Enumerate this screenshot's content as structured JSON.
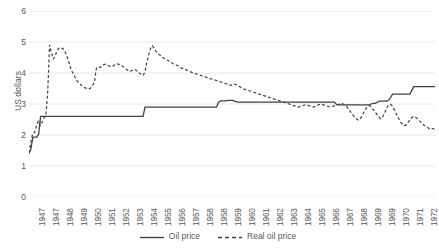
{
  "chart_data": {
    "type": "line",
    "title": "",
    "xlabel": "",
    "ylabel": "US dollars",
    "ylim": [
      0,
      6
    ],
    "yticks": [
      0,
      1,
      2,
      3,
      4,
      5,
      6
    ],
    "grid": true,
    "legend_position": "bottom",
    "xtick_labels": [
      "1947",
      "1947",
      "1948",
      "1949",
      "1950",
      "1951",
      "1952",
      "1953",
      "1954",
      "1955",
      "1956",
      "1957",
      "1958",
      "1958",
      "1959",
      "1960",
      "1961",
      "1962",
      "1963",
      "1964",
      "1965",
      "1966",
      "1967",
      "1968",
      "1969",
      "1969",
      "1970",
      "1971",
      "1972"
    ],
    "series": [
      {
        "name": "Oil price",
        "style": "solid",
        "color": "#404040",
        "values": [
          1.4,
          1.55,
          1.93,
          1.93,
          1.93,
          2.03,
          2.6,
          2.6,
          2.6,
          2.6,
          2.6,
          2.6,
          2.6,
          2.6,
          2.6,
          2.6,
          2.6,
          2.6,
          2.6,
          2.6,
          2.6,
          2.6,
          2.6,
          2.6,
          2.6,
          2.6,
          2.6,
          2.6,
          2.6,
          2.6,
          2.6,
          2.6,
          2.6,
          2.6,
          2.6,
          2.6,
          2.6,
          2.6,
          2.6,
          2.6,
          2.6,
          2.6,
          2.6,
          2.6,
          2.6,
          2.6,
          2.6,
          2.6,
          2.6,
          2.6,
          2.6,
          2.6,
          2.6,
          2.6,
          2.6,
          2.6,
          2.6,
          2.6,
          2.6,
          2.6,
          2.9,
          2.9,
          2.9,
          2.9,
          2.9,
          2.9,
          2.9,
          2.9,
          2.9,
          2.9,
          2.9,
          2.9,
          2.9,
          2.9,
          2.9,
          2.9,
          2.9,
          2.9,
          2.9,
          2.9,
          2.9,
          2.9,
          2.9,
          2.9,
          2.9,
          2.9,
          2.9,
          2.9,
          2.9,
          2.9,
          2.9,
          2.9,
          2.9,
          2.9,
          2.9,
          2.9,
          2.9,
          2.9,
          3.05,
          3.1,
          3.1,
          3.1,
          3.1,
          3.12,
          3.12,
          3.12,
          3.1,
          3.08,
          3.06,
          3.06,
          3.06,
          3.06,
          3.06,
          3.06,
          3.06,
          3.06,
          3.06,
          3.06,
          3.06,
          3.06,
          3.06,
          3.06,
          3.06,
          3.06,
          3.06,
          3.06,
          3.06,
          3.06,
          3.06,
          3.06,
          3.06,
          3.06,
          3.06,
          3.06,
          3.06,
          3.06,
          3.06,
          3.06,
          3.06,
          3.06,
          3.06,
          3.06,
          3.06,
          3.06,
          3.06,
          3.06,
          3.06,
          3.06,
          3.06,
          3.06,
          3.06,
          3.06,
          3.06,
          3.06,
          3.06,
          3.06,
          3.06,
          3.06,
          3.06,
          2.99,
          2.97,
          2.97,
          2.97,
          2.97,
          2.97,
          2.97,
          2.97,
          2.97,
          2.97,
          2.97,
          2.97,
          2.97,
          2.97,
          2.97,
          2.97,
          2.97,
          2.97,
          3.0,
          3.02,
          3.02,
          3.05,
          3.09,
          3.09,
          3.09,
          3.09,
          3.09,
          3.12,
          3.2,
          3.32,
          3.32,
          3.32,
          3.32,
          3.32,
          3.32,
          3.32,
          3.32,
          3.32,
          3.32,
          3.44,
          3.56,
          3.56,
          3.56,
          3.56,
          3.56,
          3.56,
          3.56,
          3.56,
          3.56,
          3.56,
          3.56,
          3.56
        ]
      },
      {
        "name": "Real oil price",
        "style": "dashed",
        "color": "#404040",
        "values": [
          1.42,
          1.78,
          2.05,
          2.08,
          2.3,
          2.45,
          2.3,
          2.42,
          2.55,
          2.62,
          3.4,
          4.9,
          4.65,
          4.45,
          4.55,
          4.72,
          4.8,
          4.78,
          4.8,
          4.72,
          4.58,
          4.42,
          4.2,
          4.05,
          3.95,
          3.8,
          3.72,
          3.68,
          3.6,
          3.55,
          3.52,
          3.5,
          3.48,
          3.52,
          3.6,
          3.72,
          4.15,
          4.2,
          4.18,
          4.22,
          4.28,
          4.28,
          4.25,
          4.22,
          4.2,
          4.22,
          4.28,
          4.3,
          4.28,
          4.25,
          4.22,
          4.18,
          4.12,
          4.08,
          4.05,
          4.08,
          4.12,
          4.1,
          4.05,
          4.0,
          3.96,
          3.92,
          4.05,
          4.35,
          4.6,
          4.8,
          4.88,
          4.78,
          4.68,
          4.62,
          4.58,
          4.52,
          4.48,
          4.45,
          4.42,
          4.38,
          4.34,
          4.3,
          4.28,
          4.25,
          4.22,
          4.18,
          4.15,
          4.12,
          4.1,
          4.08,
          4.05,
          4.02,
          4.0,
          3.98,
          3.96,
          3.94,
          3.92,
          3.9,
          3.88,
          3.86,
          3.84,
          3.82,
          3.8,
          3.78,
          3.76,
          3.74,
          3.72,
          3.7,
          3.68,
          3.66,
          3.64,
          3.62,
          3.6,
          3.62,
          3.64,
          3.62,
          3.58,
          3.54,
          3.5,
          3.48,
          3.46,
          3.44,
          3.42,
          3.4,
          3.38,
          3.36,
          3.34,
          3.32,
          3.3,
          3.28,
          3.26,
          3.24,
          3.22,
          3.2,
          3.18,
          3.16,
          3.14,
          3.12,
          3.1,
          3.08,
          3.06,
          3.04,
          3.02,
          3.0,
          2.98,
          2.96,
          2.94,
          2.92,
          2.9,
          2.92,
          2.94,
          2.96,
          2.98,
          2.96,
          2.94,
          2.92,
          2.9,
          2.92,
          2.95,
          2.98,
          3.0,
          2.98,
          2.96,
          2.94,
          2.92,
          2.9,
          2.92,
          2.94,
          2.96,
          2.98,
          3.0,
          3.02,
          3.0,
          2.96,
          2.9,
          2.82,
          2.74,
          2.66,
          2.58,
          2.52,
          2.48,
          2.52,
          2.62,
          2.74,
          2.84,
          2.92,
          2.95,
          2.9,
          2.82,
          2.74,
          2.66,
          2.58,
          2.52,
          2.58,
          2.7,
          2.85,
          2.95,
          3.0,
          2.95,
          2.85,
          2.72,
          2.6,
          2.48,
          2.38,
          2.32,
          2.3,
          2.36,
          2.44,
          2.52,
          2.58,
          2.6,
          2.56,
          2.5,
          2.44,
          2.38,
          2.32,
          2.28,
          2.24,
          2.2,
          2.22,
          2.2,
          2.18
        ]
      }
    ]
  },
  "legend": {
    "items": [
      {
        "label": "Oil price",
        "style": "solid"
      },
      {
        "label": "Real oil price",
        "style": "dashed"
      }
    ]
  }
}
